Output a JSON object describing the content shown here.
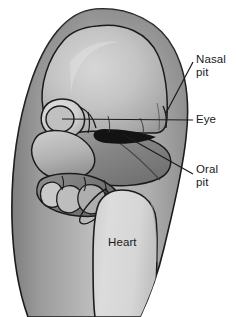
{
  "figure": {
    "name": "human-embryo-lateral-view",
    "background_color": "#ffffff",
    "width": 237,
    "height": 317
  },
  "callouts": [
    {
      "id": "nasal-pit",
      "label": "Nasal\npit",
      "leader": "diagonal",
      "text_color": "#1a1a1a"
    },
    {
      "id": "eye",
      "label": "Eye",
      "leader": "horizontal",
      "text_color": "#1a1a1a"
    },
    {
      "id": "oral-pit",
      "label": "Oral\npit",
      "leader": "diagonal",
      "text_color": "#1a1a1a"
    }
  ],
  "organ_labels": [
    {
      "id": "heart",
      "label": "Heart",
      "text_color": "#1a1a1a"
    }
  ],
  "colors": {
    "background": "#ffffff",
    "outline": "#1b1b1b",
    "body_light": "#d8d8d8",
    "body_mid": "#b3b3b3",
    "body_dark": "#8d8d8d",
    "body_darker": "#6f6f6f",
    "head_light": "#cccccc",
    "head_mid": "#a8a8a8",
    "arch_dark": "#7a7a7a",
    "heart_fill": "#d4d4d4",
    "eye_fill": "#c2c2c2",
    "oral_pit_fill": "#1b1b1b",
    "highlight": "#ededed"
  }
}
